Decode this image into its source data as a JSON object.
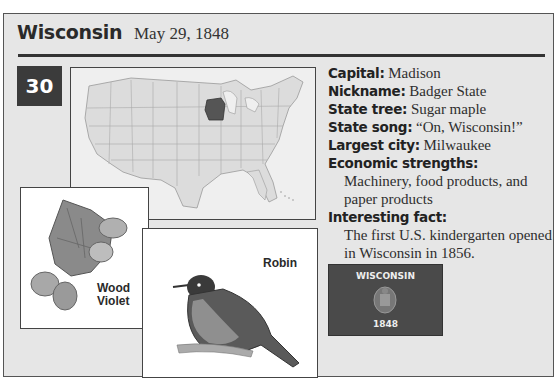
{
  "header": {
    "state_name": "Wisconsin",
    "admission_date": "May 29, 1848"
  },
  "order_badge": "30",
  "map": {
    "highlighted_state": "Wisconsin",
    "highlight_color": "#555555",
    "base_color": "#dcdcdc"
  },
  "facts": [
    {
      "label": "Capital:",
      "value": "Madison"
    },
    {
      "label": "Nickname:",
      "value": "Badger State"
    },
    {
      "label": "State tree:",
      "value": "Sugar maple"
    },
    {
      "label": "State song:",
      "value": "“On, Wisconsin!”"
    },
    {
      "label": "Largest city:",
      "value": "Milwaukee"
    }
  ],
  "economic": {
    "label": "Economic strengths:",
    "value": "Machinery, food products, and paper products"
  },
  "interesting": {
    "label": "Interesting fact:",
    "value": "The first U.S. kindergarten opened in Wisconsin in 1856."
  },
  "flag": {
    "top_text": "WISCONSIN",
    "bottom_text": "1848"
  },
  "flower": {
    "caption_line1": "Wood",
    "caption_line2": "Violet"
  },
  "bird": {
    "caption": "Robin"
  }
}
